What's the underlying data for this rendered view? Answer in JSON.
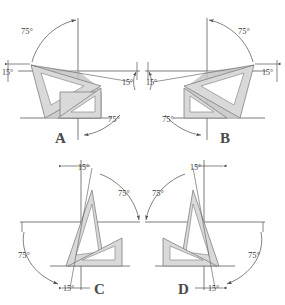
{
  "figure": {
    "background_color": "#ffffff",
    "line_color": "#5a5a5a",
    "triangle_fill": "#d9d9d9",
    "shade_fill": "#c4c4c4"
  },
  "panels": [
    {
      "id": "A",
      "label": "A",
      "annotations": [
        {
          "name": "top-left-75",
          "text": "75°"
        },
        {
          "name": "left-15",
          "text": "15°"
        },
        {
          "name": "center-15",
          "text": "15°"
        },
        {
          "name": "bottom-75",
          "text": "75°"
        }
      ]
    },
    {
      "id": "B",
      "label": "B",
      "annotations": [
        {
          "name": "top-right-75",
          "text": "75°"
        },
        {
          "name": "right-15",
          "text": "15°"
        },
        {
          "name": "center-15",
          "text": "15°"
        },
        {
          "name": "left-15",
          "text": "15°"
        },
        {
          "name": "bottom-75",
          "text": "75°"
        }
      ]
    },
    {
      "id": "C",
      "label": "C",
      "annotations": [
        {
          "name": "top-15",
          "text": "15°"
        },
        {
          "name": "right-75",
          "text": "75°"
        },
        {
          "name": "left-75",
          "text": "75°"
        },
        {
          "name": "bottom-15",
          "text": "15°"
        }
      ]
    },
    {
      "id": "D",
      "label": "D",
      "annotations": [
        {
          "name": "top-15",
          "text": "15°"
        },
        {
          "name": "left-75",
          "text": "75°"
        },
        {
          "name": "right-75",
          "text": "75°"
        },
        {
          "name": "bottom-15",
          "text": "15°"
        }
      ]
    }
  ],
  "text": {
    "a_75_top": "75°",
    "a_15_left": "15°",
    "a_15_center": "15°",
    "a_75_bottom": "75°",
    "a_label": "A",
    "b_75_top": "75°",
    "b_15_right": "15°",
    "b_15_center": "15°",
    "b_15_left": "15°",
    "b_75_bottom": "75°",
    "b_label": "B",
    "c_15_top": "15°",
    "c_75_right": "75°",
    "c_75_left": "75°",
    "c_15_bottom": "15°",
    "c_label": "C",
    "d_15_top": "15°",
    "d_75_left": "75°",
    "d_75_right": "75°",
    "d_15_bottom": "15°",
    "d_label": "D"
  }
}
